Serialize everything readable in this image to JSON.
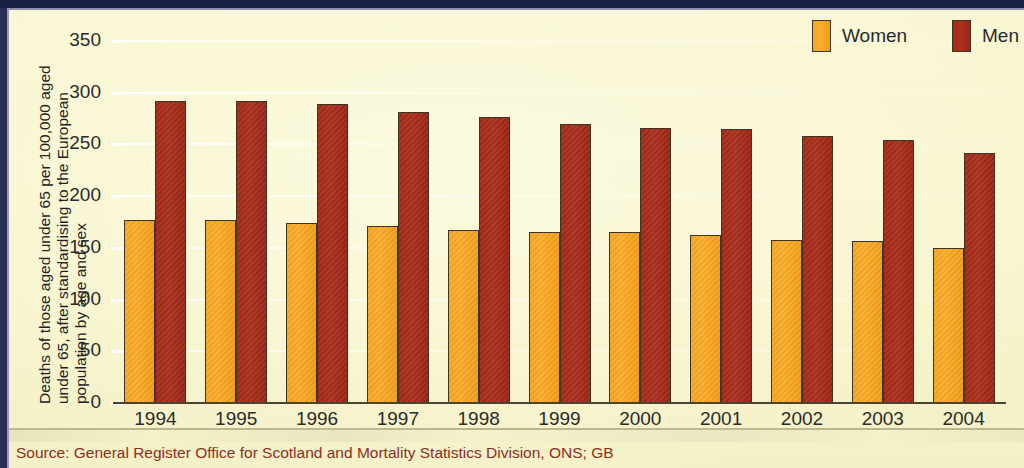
{
  "figure": {
    "y_axis_title_lines": [
      "Deaths of those aged under 65 per 100,000 aged",
      "under 65, after standardising to the European",
      "population by age and sex"
    ],
    "source_note": "Source: General Register Office for Scotland and Mortality Statistics Division, ONS; GB"
  },
  "legend": {
    "position": "top-right",
    "items": [
      {
        "label": "Women",
        "color": "#f7a623"
      },
      {
        "label": "Men",
        "color": "#a52a19"
      }
    ]
  },
  "colors": {
    "page_background": "#f8f5cf",
    "top_band": "#1a1f46",
    "women_bar": "#f7a623",
    "men_bar": "#a52a19",
    "axis": "#4a4430",
    "gridline": "#ffffff",
    "source_text": "#8c2f1e",
    "tick_text": "#2b2b2b"
  },
  "chart_data": {
    "type": "bar",
    "title": "",
    "subtitle": "",
    "xlabel": "",
    "ylabel": "Deaths of those aged under 65 per 100,000 aged under 65, after standardising to the European population by age and sex",
    "categories": [
      "1994",
      "1995",
      "1996",
      "1997",
      "1998",
      "1999",
      "2000",
      "2001",
      "2002",
      "2003",
      "2004"
    ],
    "series": [
      {
        "name": "Women",
        "color": "#f7a623",
        "values": [
          177,
          177,
          174,
          171,
          167,
          165,
          165,
          162,
          158,
          157,
          150
        ]
      },
      {
        "name": "Men",
        "color": "#a52a19",
        "values": [
          292,
          292,
          289,
          281,
          277,
          270,
          266,
          265,
          258,
          254,
          242
        ]
      }
    ],
    "ylim": [
      0,
      350
    ],
    "yticks": [
      0,
      50,
      100,
      150,
      200,
      250,
      300,
      350
    ],
    "ytick_labels": [
      "0",
      "50",
      "100",
      "150",
      "200",
      "250",
      "300",
      "350"
    ],
    "grid": true,
    "grid_axis": "y",
    "legend_position": "top right",
    "annotations": []
  }
}
